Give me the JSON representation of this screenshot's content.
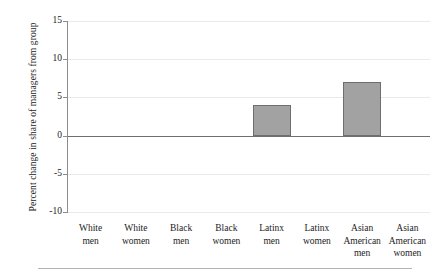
{
  "chart_data": {
    "type": "bar",
    "title": "",
    "xlabel": "",
    "ylabel": "Percent change in share of managers from group",
    "categories": [
      "White\nmen",
      "White\nwomen",
      "Black\nmen",
      "Black\nwomen",
      "Latinx\nmen",
      "Latinx\nwomen",
      "Asian\nAmerican\nmen",
      "Asian\nAmerican\nwomen"
    ],
    "values": [
      0,
      0,
      0,
      0,
      4,
      0,
      7,
      0
    ],
    "ylim": [
      -10,
      15
    ],
    "yticks": [
      15,
      10,
      5,
      0,
      -5,
      -10
    ],
    "ytick_labels": [
      "15",
      "10",
      "5",
      "0",
      "-5",
      "-10"
    ],
    "grid": true,
    "legend": "none",
    "bar_fill_color": "#a2a2a2",
    "bar_edge_color": "#6e6e6e",
    "zero_line_color": "#6f6f6f",
    "gridline_color": "#e9e9e9"
  }
}
